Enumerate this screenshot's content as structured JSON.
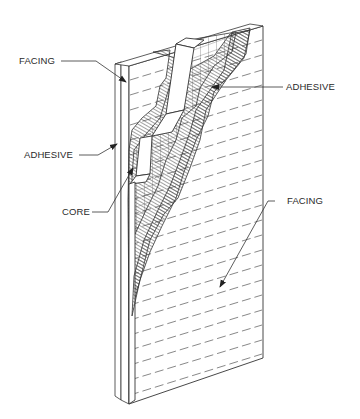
{
  "diagram": {
    "labels": {
      "facing_top": "FACING",
      "adhesive_right": "ADHESIVE",
      "adhesive_left": "ADHESIVE",
      "core": "CORE",
      "facing_bottom": "FACING"
    },
    "colors": {
      "line": "#333333",
      "background": "#ffffff",
      "text": "#2a2a2a"
    }
  }
}
